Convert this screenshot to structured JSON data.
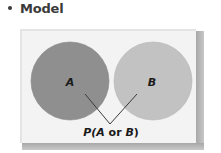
{
  "heading": {
    "bullet": "•",
    "title": "Model"
  },
  "diagram": {
    "type": "venn",
    "sets": [
      {
        "name": "A",
        "label": "A",
        "color": "#8f8f8f"
      },
      {
        "name": "B",
        "label": "B",
        "color": "#c2c2c2"
      }
    ],
    "caption": {
      "p": "P(",
      "a": "A",
      "or": " or ",
      "b": "B",
      "close": ")"
    },
    "frame_color": "#f3f3f3",
    "shadow_color": "#b0b0b0"
  }
}
